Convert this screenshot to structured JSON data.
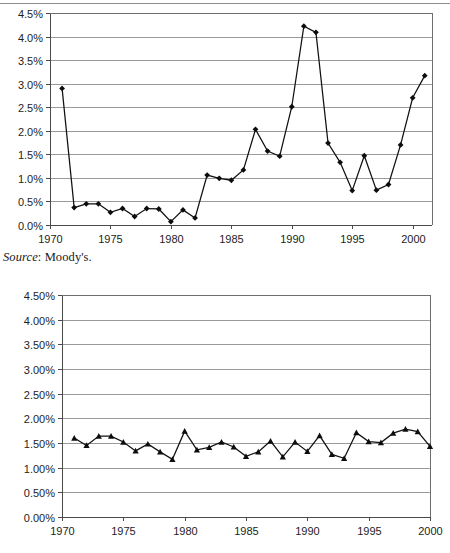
{
  "page": {
    "source_note_word": "Source",
    "source_note_rest": ": Moody's."
  },
  "chart_data": [
    {
      "id": "chart-top",
      "type": "line",
      "title": "",
      "subtitle": "",
      "xlabel": "",
      "ylabel": "",
      "grid": true,
      "legend": "none",
      "marker": "diamond",
      "xlim": [
        1970,
        2001.6
      ],
      "ylim": [
        0.0,
        4.5
      ],
      "ytick_labels": [
        "0.0%",
        "0.5%",
        "1.0%",
        "1.5%",
        "2.0%",
        "2.5%",
        "3.0%",
        "3.5%",
        "4.0%",
        "4.5%"
      ],
      "ytick_values": [
        0.0,
        0.5,
        1.0,
        1.5,
        2.0,
        2.5,
        3.0,
        3.5,
        4.0,
        4.5
      ],
      "xtick_labels": [
        "1970",
        "1975",
        "1980",
        "1985",
        "1990",
        "1995",
        "2000"
      ],
      "xtick_values": [
        1970,
        1975,
        1980,
        1985,
        1990,
        1995,
        2000
      ],
      "x": [
        1971,
        1972,
        1973,
        1974,
        1975,
        1976,
        1977,
        1978,
        1979,
        1980,
        1981,
        1982,
        1983,
        1984,
        1985,
        1986,
        1987,
        1988,
        1989,
        1990,
        1991,
        1992,
        1993,
        1994,
        1995,
        1996,
        1997,
        1998,
        1999,
        2000,
        2001
      ],
      "values": [
        2.9,
        0.37,
        0.45,
        0.45,
        0.27,
        0.35,
        0.18,
        0.35,
        0.34,
        0.07,
        0.32,
        0.15,
        1.06,
        0.99,
        0.95,
        1.17,
        2.03,
        1.57,
        1.46,
        2.51,
        4.22,
        4.09,
        1.74,
        1.33,
        0.73,
        1.47,
        0.74,
        0.86,
        1.7,
        2.7,
        3.17
      ]
    },
    {
      "id": "chart-bottom",
      "type": "line",
      "title": "",
      "subtitle": "",
      "xlabel": "",
      "ylabel": "",
      "grid": true,
      "legend": "none",
      "marker": "triangle",
      "xlim": [
        1970,
        2000
      ],
      "ylim": [
        0.0,
        4.5
      ],
      "ytick_labels": [
        "0.00%",
        "0.50%",
        "1.00%",
        "1.50%",
        "2.00%",
        "2.50%",
        "3.00%",
        "3.50%",
        "4.00%",
        "4.50%"
      ],
      "ytick_values": [
        0.0,
        0.5,
        1.0,
        1.5,
        2.0,
        2.5,
        3.0,
        3.5,
        4.0,
        4.5
      ],
      "xtick_labels": [
        "1970",
        "1975",
        "1980",
        "1985",
        "1990",
        "1995",
        "2000"
      ],
      "xtick_values": [
        1970,
        1975,
        1980,
        1985,
        1990,
        1995,
        2000
      ],
      "x": [
        1971,
        1972,
        1973,
        1974,
        1975,
        1976,
        1977,
        1978,
        1979,
        1980,
        1981,
        1982,
        1983,
        1984,
        1985,
        1986,
        1987,
        1988,
        1989,
        1990,
        1991,
        1992,
        1993,
        1994,
        1995,
        1996,
        1997,
        1998,
        1999,
        2000
      ],
      "values": [
        1.6,
        1.45,
        1.64,
        1.64,
        1.52,
        1.34,
        1.48,
        1.32,
        1.17,
        1.74,
        1.36,
        1.41,
        1.52,
        1.42,
        1.23,
        1.32,
        1.54,
        1.22,
        1.52,
        1.33,
        1.65,
        1.27,
        1.19,
        1.71,
        1.53,
        1.51,
        1.7,
        1.78,
        1.73,
        1.43
      ]
    }
  ]
}
